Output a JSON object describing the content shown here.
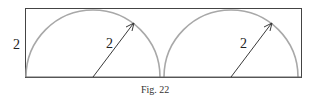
{
  "figure": {
    "caption": "Fig. 22",
    "height_label": "2",
    "radius_labels": [
      "2",
      "2"
    ],
    "colors": {
      "frame": "#444444",
      "arc": "#a8a8a8",
      "arrow": "#222222"
    }
  }
}
